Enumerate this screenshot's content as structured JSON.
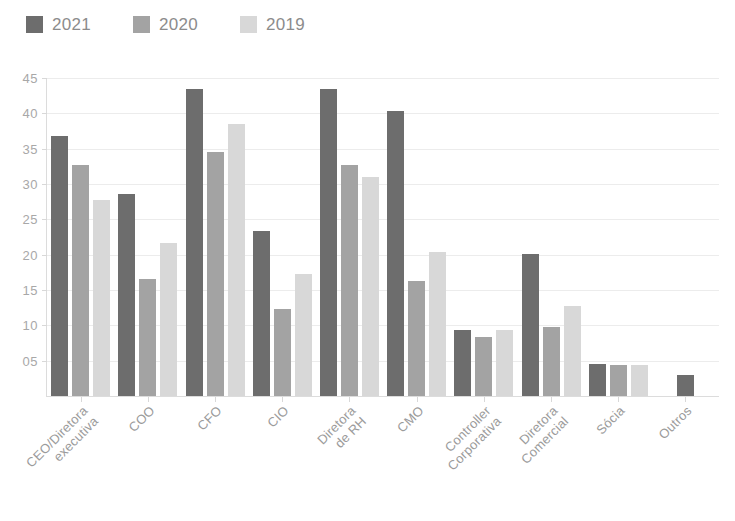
{
  "legend": {
    "position": "top-left",
    "entries": [
      {
        "label": "2021",
        "color": "#6d6d6d",
        "icon": "legend-swatch"
      },
      {
        "label": "2020",
        "color": "#a3a3a3",
        "icon": "legend-swatch"
      },
      {
        "label": "2019",
        "color": "#d8d8d8",
        "icon": "legend-swatch"
      }
    ]
  },
  "axis": {
    "y_ticks": [
      "05",
      "10",
      "15",
      "20",
      "25",
      "30",
      "35",
      "40",
      "45"
    ],
    "y_tick_values": [
      5,
      10,
      15,
      20,
      25,
      30,
      35,
      40,
      45
    ]
  },
  "chart_data": {
    "type": "bar",
    "title": "",
    "xlabel": "",
    "ylabel": "",
    "ylim": [
      0,
      45
    ],
    "grid": true,
    "legend_position": "top-left",
    "categories": [
      "CEO/Diretora executiva",
      "COO",
      "CFO",
      "CIO",
      "Diretora de RH",
      "CMO",
      "Controller Corporativa",
      "Diretora Comercial",
      "Sócia",
      "Outros"
    ],
    "category_lines": [
      [
        "CEO/Diretora",
        "executiva"
      ],
      [
        "COO"
      ],
      [
        "CFO"
      ],
      [
        "CIO"
      ],
      [
        "Diretora",
        "de RH"
      ],
      [
        "CMO"
      ],
      [
        "Controller",
        "Corporativa"
      ],
      [
        "Diretora",
        "Comercial"
      ],
      [
        "Sócia"
      ],
      [
        "Outros"
      ]
    ],
    "series": [
      {
        "name": "2021",
        "color": "#6d6d6d",
        "values": [
          36.8,
          28.6,
          43.5,
          23.4,
          43.5,
          40.4,
          9.4,
          20.1,
          4.5,
          3.0
        ]
      },
      {
        "name": "2020",
        "color": "#a3a3a3",
        "values": [
          32.7,
          16.5,
          34.5,
          12.3,
          32.7,
          16.3,
          8.4,
          9.7,
          4.4,
          null
        ]
      },
      {
        "name": "2019",
        "color": "#d8d8d8",
        "values": [
          27.7,
          21.7,
          38.5,
          17.3,
          31.0,
          20.4,
          9.3,
          12.8,
          4.4,
          null
        ]
      }
    ]
  }
}
